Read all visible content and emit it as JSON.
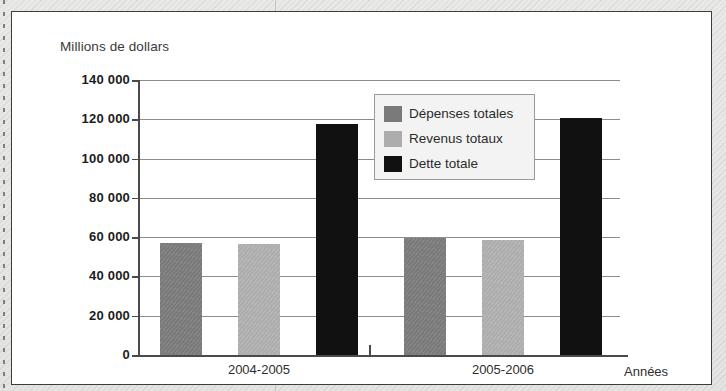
{
  "figure": {
    "y_axis_title": "Millions de dollars",
    "x_axis_title": "Années"
  },
  "legend": {
    "items": [
      {
        "label": "Dépenses totales",
        "color": "#7a7a7a",
        "swatch_name": "legend-swatch-depenses"
      },
      {
        "label": "Revenus totaux",
        "color": "#adadad",
        "swatch_name": "legend-swatch-revenus"
      },
      {
        "label": "Dette totale",
        "color": "#111111",
        "swatch_name": "legend-swatch-dette"
      }
    ]
  },
  "chart_data": {
    "type": "bar",
    "title": "",
    "subtitle": "",
    "xlabel": "Années",
    "ylabel": "Millions de dollars",
    "categories": [
      "2004-2005",
      "2005-2006"
    ],
    "series": [
      {
        "name": "Dépenses totales",
        "color": "#7a7a7a",
        "values": [
          57000,
          59500
        ]
      },
      {
        "name": "Revenus totaux",
        "color": "#adadad",
        "values": [
          56500,
          58500
        ]
      },
      {
        "name": "Dette totale",
        "color": "#111111",
        "values": [
          117500,
          120500
        ]
      }
    ],
    "ylim": [
      0,
      140000
    ],
    "ytick_values": [
      0,
      20000,
      40000,
      60000,
      80000,
      100000,
      120000,
      140000
    ],
    "ytick_labels": [
      "0",
      "20 000",
      "40 000",
      "60 000",
      "80 000",
      "100 000",
      "120 000",
      "140 000"
    ],
    "grid": true,
    "grid_axis": "y",
    "legend_position": "inside-upper-center"
  }
}
